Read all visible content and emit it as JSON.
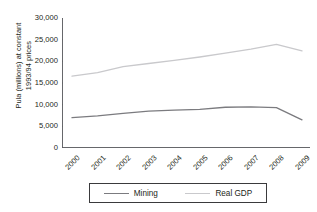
{
  "chart_data": {
    "type": "line",
    "title": "",
    "xlabel": "",
    "ylabel": "Pula (millions) at constant 1993/94 prices",
    "ylabel_lines": [
      "Pula (millions) at constant",
      "1993/94 prices"
    ],
    "categories": [
      "2000",
      "2001",
      "2002",
      "2003",
      "2004",
      "2005",
      "2006",
      "2007",
      "2008",
      "2009"
    ],
    "ylim": [
      0,
      30000
    ],
    "ytick_values": [
      30000,
      25000,
      20000,
      15000,
      10000,
      5000,
      0
    ],
    "ytick_labels": [
      "30,000",
      "25,000",
      "20,000",
      "15,000",
      "10,000",
      "5,000",
      "0"
    ],
    "grid": false,
    "legend_position": "bottom",
    "series": [
      {
        "name": "Mining",
        "color": "#7b7b7f",
        "values": [
          7000,
          7400,
          8000,
          8500,
          8750,
          8900,
          9400,
          9500,
          9300,
          6500
        ]
      },
      {
        "name": "Real GDP",
        "color": "#c9c9cc",
        "values": [
          16600,
          17400,
          18800,
          19500,
          20200,
          21000,
          21900,
          22800,
          23900,
          22400
        ]
      }
    ]
  },
  "legend": {
    "entries": [
      {
        "label": "Mining"
      },
      {
        "label": "Real GDP"
      }
    ]
  },
  "axis": {
    "line_color": "#55565a"
  }
}
